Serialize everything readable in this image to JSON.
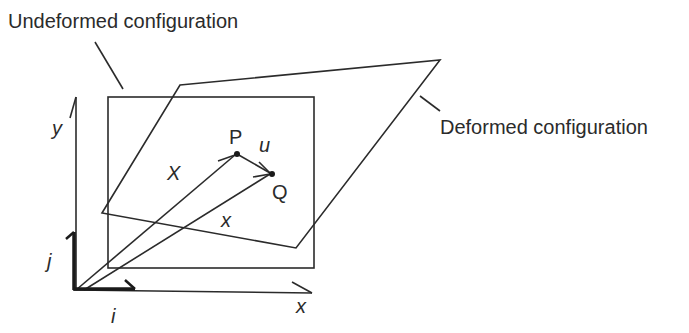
{
  "labels": {
    "undeformed": "Undeformed configuration",
    "deformed": "Deformed configuration",
    "point_p": "P",
    "point_q": "Q",
    "displacement": "u",
    "position_X": "X",
    "position_x": "x",
    "axis_y": "y",
    "axis_x": "x",
    "unit_i": "i",
    "unit_j": "j"
  },
  "colors": {
    "stroke": "#2b2b2b",
    "background": "#ffffff"
  }
}
